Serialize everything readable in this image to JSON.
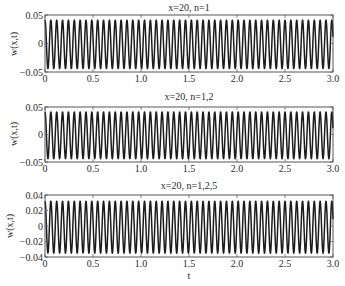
{
  "chart_data": [
    {
      "type": "line",
      "title": "x=20, n=1",
      "xlabel": "",
      "ylabel": "w(x,t)",
      "xlim": [
        0,
        3.0
      ],
      "ylim": [
        -0.05,
        0.05
      ],
      "xticks": [
        0,
        0.5,
        1.0,
        1.5,
        2.0,
        2.5,
        3.0
      ],
      "xtick_labels": [
        "0",
        "0.5",
        "1.0",
        "1.5",
        "2.0",
        "2.5",
        "3.0"
      ],
      "yticks": [
        -0.05,
        0,
        0.05
      ],
      "ytick_labels": [
        "-0.05",
        "0",
        "0.05"
      ],
      "grid": false,
      "series": [
        {
          "name": "w(x,t)",
          "shape": "sinusoid",
          "cycles_per_unit_t": 16.4,
          "peak": 0.041,
          "trough": -0.044,
          "phase_at_t0": "peak",
          "color": "#1c1c1c"
        }
      ]
    },
    {
      "type": "line",
      "title": "x=20, n=1,2",
      "xlabel": "",
      "ylabel": "w(x,t)",
      "xlim": [
        0,
        3.0
      ],
      "ylim": [
        -0.05,
        0.05
      ],
      "xticks": [
        0,
        0.5,
        1.0,
        1.5,
        2.0,
        2.5,
        3.0
      ],
      "xtick_labels": [
        "0",
        "0.5",
        "1.0",
        "1.5",
        "2.0",
        "2.5",
        "3.0"
      ],
      "yticks": [
        -0.05,
        0,
        0.05
      ],
      "ytick_labels": [
        "-0.05",
        "0",
        "0.05"
      ],
      "grid": false,
      "series": [
        {
          "name": "w(x,t)",
          "shape": "sinusoid",
          "cycles_per_unit_t": 16.4,
          "peak": 0.041,
          "trough": -0.044,
          "phase_at_t0": "peak",
          "color": "#1c1c1c"
        }
      ]
    },
    {
      "type": "line",
      "title": "x=20, n=1,2,5",
      "xlabel": "t",
      "ylabel": "w(x,t)",
      "xlim": [
        0,
        3.0
      ],
      "ylim": [
        -0.04,
        0.04
      ],
      "xticks": [
        0,
        0.5,
        1.0,
        1.5,
        2.0,
        2.5,
        3.0
      ],
      "xtick_labels": [
        "0",
        "0.5",
        "1.0",
        "1.5",
        "2.0",
        "2.5",
        "3.0"
      ],
      "yticks": [
        -0.04,
        -0.02,
        0,
        0.02,
        0.04
      ],
      "ytick_labels": [
        "-0.04",
        "-0.02",
        "0",
        "0.02",
        "0.04"
      ],
      "grid": false,
      "series": [
        {
          "name": "w(x,t)",
          "shape": "sinusoid",
          "cycles_per_unit_t": 16.4,
          "peak": 0.032,
          "trough": -0.035,
          "phase_at_t0": "peak",
          "color": "#1c1c1c"
        }
      ]
    }
  ]
}
